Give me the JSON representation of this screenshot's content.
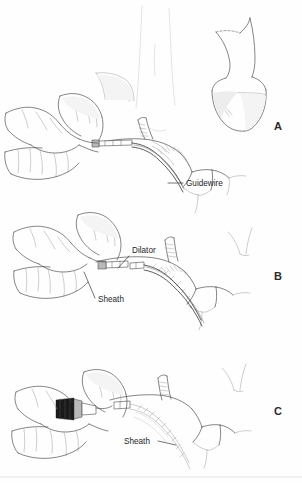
{
  "figure": {
    "background_color": "#ffffff",
    "ink_color": "#3a3a3a",
    "label_color": "#1f1f1f",
    "width": 302,
    "height": 483
  },
  "panels": [
    {
      "letter": "A",
      "letter_x": 278,
      "letter_y": 130,
      "caption": "Guidewire advanced through needle into vein",
      "labels": [
        {
          "text": "Guidewire",
          "x": 186,
          "y": 186
        }
      ]
    },
    {
      "letter": "B",
      "letter_x": 278,
      "letter_y": 280,
      "caption": "Dilator and sheath advanced over the guidewire",
      "labels": [
        {
          "text": "Dilator",
          "x": 132,
          "y": 253
        },
        {
          "text": "Sheath",
          "x": 98,
          "y": 302
        }
      ]
    },
    {
      "letter": "C",
      "letter_x": 278,
      "letter_y": 415,
      "caption": "Dilator and guidewire removed, sheath remains in place",
      "labels": [
        {
          "text": "Sheath",
          "x": 124,
          "y": 444
        }
      ]
    }
  ]
}
